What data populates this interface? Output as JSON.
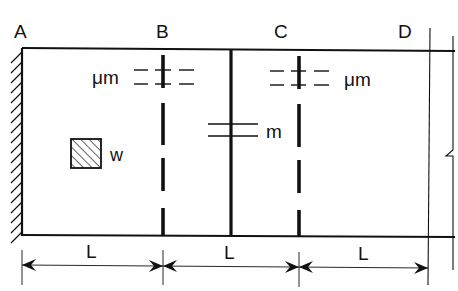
{
  "diagram": {
    "point_labels": {
      "A": "A",
      "B": "B",
      "C": "C",
      "D": "D"
    },
    "mass_labels": {
      "b_mass": "μm",
      "mid_mass": "m",
      "c_mass": "μm"
    },
    "load_label": "w",
    "dimensions": [
      "L",
      "L",
      "L"
    ],
    "colors": {
      "stroke": "#111111",
      "background": "#ffffff"
    }
  }
}
